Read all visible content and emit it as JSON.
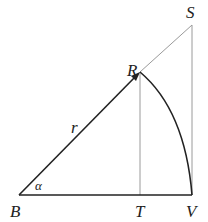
{
  "diagram": {
    "type": "geometry",
    "points": {
      "B": {
        "label": "B",
        "x": 19,
        "y": 195
      },
      "R": {
        "label": "R",
        "x": 140,
        "y": 72
      },
      "S": {
        "label": "S",
        "x": 192,
        "y": 25
      },
      "T": {
        "label": "T",
        "x": 140,
        "y": 195
      },
      "V": {
        "label": "V",
        "x": 192,
        "y": 195
      }
    },
    "labels": {
      "B": "B",
      "R": "R",
      "S": "S",
      "T": "T",
      "V": "V",
      "r": "r",
      "alpha": "α"
    },
    "colors": {
      "thick_line": "#222222",
      "thin_line": "#999999"
    }
  }
}
